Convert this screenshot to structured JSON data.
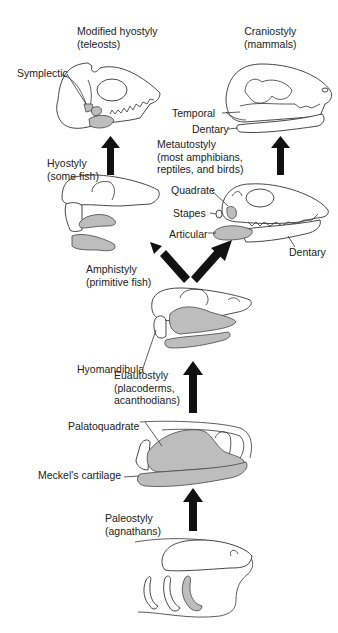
{
  "stages": {
    "modified_hyostyly": {
      "name": "Modified hyostyly",
      "group": "(teleosts)"
    },
    "craniostyly": {
      "name": "Craniostyly",
      "group": "(mammals)"
    },
    "hyostyly": {
      "name": "Hyostyly",
      "group": "(some fish)"
    },
    "metautostyly": {
      "name": "Metautostyly",
      "group_line1": "(most amphibians,",
      "group_line2": "reptiles, and birds)"
    },
    "amphistyly": {
      "name": "Amphistyly",
      "group": "(primitive fish)"
    },
    "euautostyly": {
      "name": "Euautostyly",
      "group_line1": "(placoderms,",
      "group_line2": "acanthodians)"
    },
    "paleostyly": {
      "name": "Paleostyly",
      "group": "(agnathans)"
    }
  },
  "bone_labels": {
    "symplectic": "Symplectic",
    "temporal": "Temporal",
    "dentary_mammal": "Dentary",
    "quadrate": "Quadrate",
    "stapes": "Stapes",
    "articular": "Articular",
    "dentary_reptile": "Dentary",
    "hyomandibula": "Hyomandibula",
    "palatoquadrate": "Palatoquadrate",
    "meckels_cartilage": "Meckel's cartilage"
  },
  "colors": {
    "bone_fill": "#bdbdbd",
    "arrow": "#111111",
    "outline": "#333333"
  }
}
